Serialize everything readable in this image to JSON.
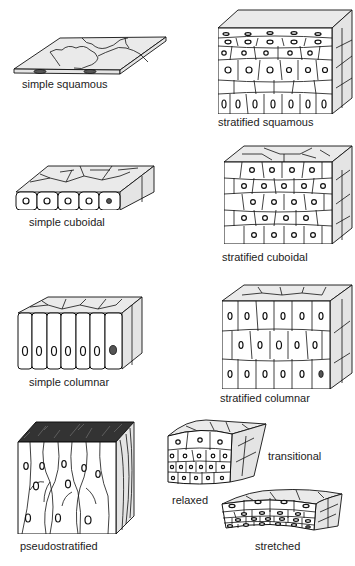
{
  "panels": {
    "simple_squamous": {
      "label": "simple squamous"
    },
    "stratified_squamous": {
      "label": "stratified squamous"
    },
    "simple_cuboidal": {
      "label": "simple cuboidal"
    },
    "stratified_cuboidal": {
      "label": "stratified cuboidal"
    },
    "simple_columnar": {
      "label": "simple columnar"
    },
    "stratified_columnar": {
      "label": "stratified columnar"
    },
    "pseudostratified": {
      "label": "pseudostratified"
    },
    "transitional": {
      "label": "transitional",
      "relaxed_label": "relaxed",
      "stretched_label": "stretched"
    }
  },
  "colors": {
    "line": "#111111",
    "shade": "#e4e4e4",
    "background": "#ffffff"
  }
}
